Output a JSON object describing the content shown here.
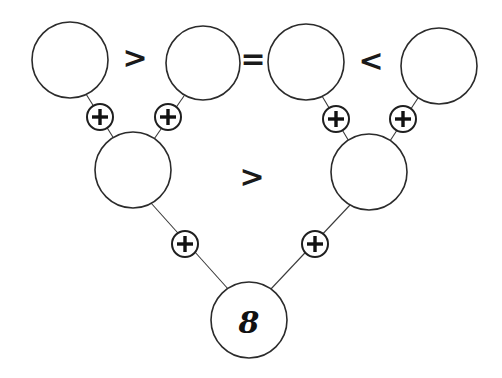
{
  "puzzle": {
    "top_row": [
      {
        "id": "a",
        "value": ""
      },
      {
        "id": "b",
        "value": ""
      },
      {
        "id": "c",
        "value": ""
      },
      {
        "id": "d",
        "value": ""
      }
    ],
    "top_relations": [
      ">",
      "=",
      "<"
    ],
    "middle_row": [
      {
        "id": "e",
        "value": ""
      },
      {
        "id": "f",
        "value": ""
      }
    ],
    "middle_relation": ">",
    "bottom": {
      "id": "g",
      "value": "8"
    },
    "operator": "+"
  }
}
